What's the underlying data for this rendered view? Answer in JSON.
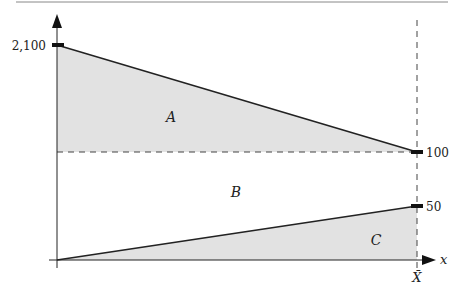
{
  "diagram": {
    "type": "area-decomposition",
    "y_ticks": [
      {
        "label": "2,100",
        "value": 2100
      },
      {
        "label": "100",
        "value": 100
      },
      {
        "label": "50",
        "value": 50
      }
    ],
    "x_axis_label": "x",
    "x_marker_label": "X̄",
    "regions": [
      {
        "id": "A",
        "label": "A",
        "description": "shaded triangle between declining line (2,100 → 100) and the 100 level"
      },
      {
        "id": "B",
        "label": "B",
        "description": "unshaded rectangle between the 100 level and the rising line"
      },
      {
        "id": "C",
        "label": "C",
        "description": "shaded triangle under rising line (0 → 50)"
      }
    ],
    "lines": [
      {
        "name": "declining",
        "from": {
          "x": 0,
          "y": 2100
        },
        "to": {
          "x": "X̄",
          "y": 100
        }
      },
      {
        "name": "rising",
        "from": {
          "x": 0,
          "y": 0
        },
        "to": {
          "x": "X̄",
          "y": 50
        }
      }
    ],
    "colors": {
      "shade": "#e2e2e2",
      "line": "#222222",
      "dash": "#444444"
    }
  }
}
